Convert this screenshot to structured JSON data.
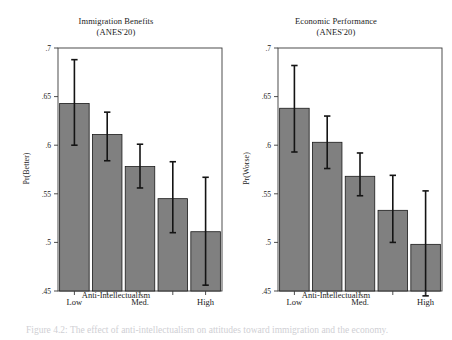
{
  "figure": {
    "background_color": "#ffffff",
    "bar_color": "#808080",
    "bar_edge_color": "#1a1a1a",
    "error_bar_color": "#141414",
    "axis_color": "#3a3a3a",
    "top_cropped_text": "predicted probabilities across anti-intellectualism",
    "caption_cropped_text": "Figure 4.2: The effect of anti-intellectualism on attitudes toward immigration and the economy."
  },
  "chart_data": [
    {
      "type": "bar",
      "panel": "left",
      "title": "Immigration Benefits",
      "subtitle": "(ANES'20)",
      "xlabel": "Anti-Intellectualism",
      "ylabel": "Pr(Better)",
      "ylim": [
        0.45,
        0.7
      ],
      "yticks": [
        0.7,
        0.65,
        0.6,
        0.55,
        0.5,
        0.45
      ],
      "ytick_labels": [
        ".7",
        ".65",
        ".6",
        ".55",
        ".5",
        ".45"
      ],
      "grid": false,
      "legend": "none",
      "categories": [
        "1",
        "2",
        "3",
        "4",
        "5"
      ],
      "tick_labels": [
        "Low",
        "",
        "Med.",
        "",
        "High"
      ],
      "values": [
        0.643,
        0.611,
        0.578,
        0.545,
        0.511
      ],
      "ci_low": [
        0.6,
        0.584,
        0.556,
        0.51,
        0.456
      ],
      "ci_high": [
        0.688,
        0.634,
        0.601,
        0.583,
        0.567
      ]
    },
    {
      "type": "bar",
      "panel": "right",
      "title": "Economic Performance",
      "subtitle": "(ANES'20)",
      "xlabel": "Anti-Intellectualism",
      "ylabel": "Pr(Worse)",
      "ylim": [
        0.45,
        0.7
      ],
      "yticks": [
        0.7,
        0.65,
        0.6,
        0.55,
        0.5,
        0.45
      ],
      "ytick_labels": [
        ".7",
        ".65",
        ".6",
        ".55",
        ".5",
        ".45"
      ],
      "grid": false,
      "legend": "none",
      "categories": [
        "1",
        "2",
        "3",
        "4",
        "5"
      ],
      "tick_labels": [
        "Low",
        "",
        "Med.",
        "",
        "High"
      ],
      "values": [
        0.638,
        0.603,
        0.568,
        0.533,
        0.498
      ],
      "ci_low": [
        0.593,
        0.576,
        0.548,
        0.5,
        0.445
      ],
      "ci_high": [
        0.682,
        0.63,
        0.592,
        0.569,
        0.553
      ]
    }
  ]
}
